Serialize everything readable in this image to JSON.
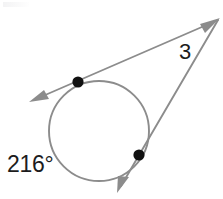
{
  "figure": {
    "type": "geometry-diagram",
    "width": 223,
    "height": 199,
    "background_color": "#ffffff",
    "stroke_color": "#8c8c8c",
    "point_color": "#111111",
    "text_color": "#1c1c1c",
    "labels": {
      "arc_measure": "216°",
      "tangent_length": "3"
    },
    "circle": {
      "center_x": 99,
      "center_y": 131,
      "radius": 50
    },
    "external_point": {
      "x": 218,
      "y": 20
    },
    "tangent_points": [
      {
        "name": "upper-left-tangent-point",
        "x": 78,
        "y": 82
      },
      {
        "name": "lower-right-tangent-point",
        "x": 139,
        "y": 155
      }
    ],
    "rays": [
      {
        "name": "upper-tangent-ray",
        "from_x": 218,
        "from_y": 20,
        "through_x": 78,
        "through_y": 82,
        "arrow_x": 31,
        "arrow_y": 101
      },
      {
        "name": "lower-tangent-ray",
        "from_x": 218,
        "from_y": 20,
        "through_x": 139,
        "through_y": 155,
        "arrow_x": 118,
        "arrow_y": 192
      },
      {
        "name": "apex-arrow-ray",
        "from_x": 160,
        "from_y": 55,
        "arrow_x": 219,
        "arrow_y": 19
      }
    ]
  }
}
